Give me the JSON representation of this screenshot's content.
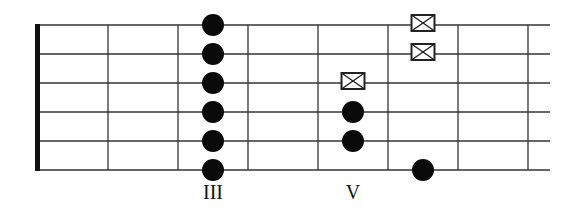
{
  "diagram": {
    "type": "guitar-fretboard",
    "strings": 6,
    "frets_shown": 7,
    "colors": {
      "line": "#333333",
      "nut": "#111111",
      "dot": "#0a0a0a",
      "box": "#222222"
    },
    "fret_labels": [
      {
        "fret": 3,
        "text": "III"
      },
      {
        "fret": 5,
        "text": "V"
      }
    ],
    "notes": [
      {
        "string": 1,
        "fret": 3,
        "marker": "dot"
      },
      {
        "string": 2,
        "fret": 3,
        "marker": "dot"
      },
      {
        "string": 3,
        "fret": 3,
        "marker": "dot"
      },
      {
        "string": 4,
        "fret": 3,
        "marker": "dot"
      },
      {
        "string": 5,
        "fret": 3,
        "marker": "dot"
      },
      {
        "string": 6,
        "fret": 3,
        "marker": "dot"
      },
      {
        "string": 3,
        "fret": 5,
        "marker": "x-box"
      },
      {
        "string": 4,
        "fret": 5,
        "marker": "dot"
      },
      {
        "string": 5,
        "fret": 5,
        "marker": "dot"
      },
      {
        "string": 1,
        "fret": 6,
        "marker": "x-box"
      },
      {
        "string": 2,
        "fret": 6,
        "marker": "x-box"
      },
      {
        "string": 6,
        "fret": 6,
        "marker": "dot"
      }
    ]
  }
}
